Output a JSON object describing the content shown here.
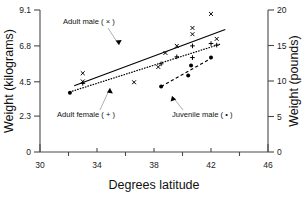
{
  "chart_data": {
    "type": "scatter",
    "title": "",
    "xlabel": "Degrees latitude",
    "ylabel": "Weight (kilograms)",
    "y2label": "Weight (pounds)",
    "xlim": [
      30,
      46
    ],
    "ylim": [
      0,
      9.1
    ],
    "y2lim": [
      0,
      20
    ],
    "grid": false,
    "legend_position": "inline-annotations",
    "xticks": [
      30,
      34,
      38,
      42,
      46
    ],
    "xticklabels": [
      "30",
      "34",
      "38",
      "42",
      "46"
    ],
    "xminorticks": [
      32,
      36,
      40,
      44
    ],
    "yticks": [
      0,
      2.3,
      4.5,
      6.8,
      9.1
    ],
    "yticklabels": [
      "0",
      "2.3",
      "4.5",
      "6.8",
      "9.1"
    ],
    "y2ticks": [
      0,
      5,
      10,
      15,
      20
    ],
    "y2ticklabels": [
      "0",
      "5",
      "10",
      "15",
      "20"
    ],
    "series": [
      {
        "name": "Adult male",
        "marker": "x",
        "trendline": "solid",
        "trend_x": [
          32.4,
          43.0
        ],
        "trend_y": [
          4.25,
          7.85
        ],
        "points": [
          {
            "x": 33.0,
            "y": 5.05
          },
          {
            "x": 33.0,
            "y": 4.52
          },
          {
            "x": 36.6,
            "y": 4.47
          },
          {
            "x": 38.3,
            "y": 5.45
          },
          {
            "x": 38.8,
            "y": 6.35
          },
          {
            "x": 39.6,
            "y": 6.8
          },
          {
            "x": 40.7,
            "y": 7.95
          },
          {
            "x": 40.7,
            "y": 7.55
          },
          {
            "x": 42.0,
            "y": 8.85
          },
          {
            "x": 42.4,
            "y": 7.25
          }
        ]
      },
      {
        "name": "Adult female",
        "marker": "+",
        "trendline": "dotted",
        "trend_x": [
          32.1,
          42.6
        ],
        "trend_y": [
          3.85,
          6.9
        ],
        "points": [
          {
            "x": 33.0,
            "y": 4.4
          },
          {
            "x": 38.5,
            "y": 5.65
          },
          {
            "x": 39.6,
            "y": 6.1
          },
          {
            "x": 40.7,
            "y": 6.8
          },
          {
            "x": 40.7,
            "y": 6.05
          },
          {
            "x": 42.0,
            "y": 6.95
          },
          {
            "x": 42.4,
            "y": 6.85
          }
        ]
      },
      {
        "name": "Juvenile male",
        "marker": "dot",
        "trendline": "dashed",
        "trend_x": [
          38.5,
          42.1
        ],
        "trend_y": [
          4.2,
          6.05
        ],
        "points": [
          {
            "x": 32.1,
            "y": 3.8
          },
          {
            "x": 38.5,
            "y": 4.2
          },
          {
            "x": 40.4,
            "y": 4.9
          },
          {
            "x": 40.6,
            "y": 5.55
          },
          {
            "x": 42.0,
            "y": 6.05
          }
        ]
      }
    ],
    "annotations": [
      {
        "id": "adult-male",
        "text": "Adult male ( × )"
      },
      {
        "id": "adult-female",
        "text": "Adult female ( + )"
      },
      {
        "id": "juvenile-male",
        "text": "Juvenile male ( • )"
      }
    ]
  }
}
